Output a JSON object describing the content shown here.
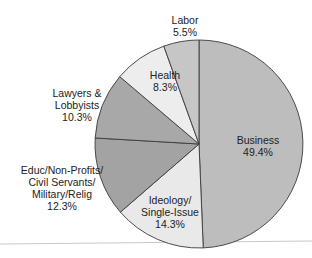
{
  "chart_data": {
    "type": "pie",
    "title": "",
    "categories": [
      "Business",
      "Ideology/Single-Issue",
      "Educ/Non-Profits/Civil Servants/Military/Relig",
      "Lawyers & Lobbyists",
      "Health",
      "Labor"
    ],
    "values": [
      49.4,
      14.3,
      12.3,
      10.3,
      8.3,
      5.5
    ],
    "unit": "%",
    "start_angle": "12 o'clock",
    "direction": "clockwise",
    "colors": [
      "#bdbdbd",
      "#e9e9e9",
      "#a3a3a3",
      "#a8a8a8",
      "#ededed",
      "#c6c6c6"
    ]
  },
  "labels": {
    "business": {
      "name": "Business",
      "value": "49.4%"
    },
    "ideology": {
      "name1": "Ideology/",
      "name2": "Single-Issue",
      "value": "14.3%"
    },
    "educ": {
      "name1": "Educ/Non-Profits/",
      "name2": "Civil Servants/",
      "name3": "Military/Relig",
      "value": "12.3%"
    },
    "lawyers": {
      "name1": "Lawyers &",
      "name2": "Lobbyists",
      "value": "10.3%"
    },
    "health": {
      "name": "Health",
      "value": "8.3%"
    },
    "labor": {
      "name": "Labor",
      "value": "5.5%"
    }
  }
}
